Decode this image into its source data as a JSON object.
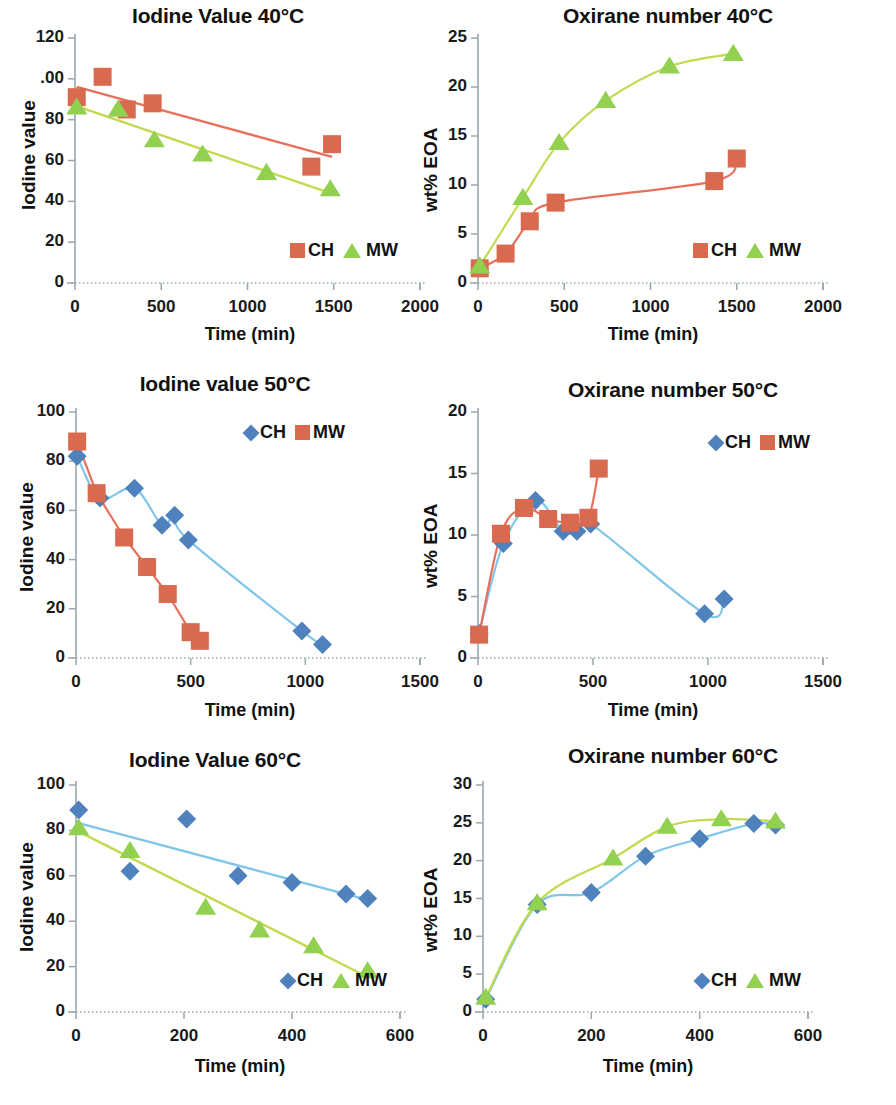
{
  "figure": {
    "panel_count": 6,
    "series_colors": {
      "CH_red": "#d9694f",
      "CH_blue": "#4f81bd",
      "MW_green": "#92d050",
      "trend_red": "#e8705b",
      "trend_green": "#c3d94e",
      "trend_blue": "#7fc6e8",
      "axis": "#9aa6ad"
    }
  },
  "chart_data": [
    {
      "id": "iodine-40",
      "type": "scatter",
      "title": "Iodine Value 40°C",
      "xlabel": "Time (min)",
      "ylabel": "Iodine value",
      "xlim": [
        0,
        2000
      ],
      "ylim": [
        0,
        120
      ],
      "xticks": [
        0,
        500,
        1000,
        1500,
        2000
      ],
      "yticks": [
        0,
        20,
        40,
        60,
        80,
        100,
        120
      ],
      "ytick_labels": [
        "0",
        "20",
        "40",
        "60",
        "80",
        ".00",
        "120"
      ],
      "grid": false,
      "legend_position": "bottom-right",
      "series": [
        {
          "name": "CH",
          "marker": "square",
          "color": "#d9694f",
          "trend": "linear",
          "trend_color": "#e8705b",
          "x": [
            10,
            160,
            300,
            450,
            1370,
            1490
          ],
          "y": [
            91,
            101,
            85,
            88,
            57,
            68
          ]
        },
        {
          "name": "MW",
          "marker": "triangle",
          "color": "#92d050",
          "trend": "linear",
          "trend_color": "#c3d94e",
          "x": [
            10,
            250,
            460,
            740,
            1110,
            1480
          ],
          "y": [
            86,
            85,
            70,
            63,
            54,
            46
          ]
        }
      ]
    },
    {
      "id": "oxirane-40",
      "type": "scatter",
      "title": "Oxirane number 40°C",
      "xlabel": "Time (min)",
      "ylabel": "wt% EOA",
      "xlim": [
        0,
        2000
      ],
      "ylim": [
        0,
        25
      ],
      "xticks": [
        0,
        500,
        1000,
        1500,
        2000
      ],
      "yticks": [
        0,
        5,
        10,
        15,
        20,
        25
      ],
      "ytick_labels": [
        "0",
        "5",
        "10",
        "15",
        "20",
        "25"
      ],
      "grid": false,
      "legend_position": "bottom-right",
      "series": [
        {
          "name": "CH",
          "marker": "square",
          "color": "#d9694f",
          "trend": "smooth",
          "trend_color": "#e8705b",
          "x": [
            10,
            160,
            300,
            450,
            1370,
            1500
          ],
          "y": [
            1.5,
            3.0,
            6.3,
            8.2,
            10.4,
            12.7
          ]
        },
        {
          "name": "MW",
          "marker": "triangle",
          "color": "#92d050",
          "trend": "smooth",
          "trend_color": "#c3d94e",
          "x": [
            10,
            260,
            470,
            740,
            1110,
            1480
          ],
          "y": [
            1.7,
            8.7,
            14.3,
            18.6,
            22.1,
            23.4
          ]
        }
      ]
    },
    {
      "id": "iodine-50",
      "type": "scatter",
      "title": "Iodine value 50°C",
      "xlabel": "Time (min)",
      "ylabel": "Iodine value",
      "xlim": [
        0,
        1500
      ],
      "ylim": [
        0,
        100
      ],
      "xticks": [
        0,
        500,
        1000,
        1500
      ],
      "yticks": [
        0,
        20,
        40,
        60,
        80,
        100
      ],
      "ytick_labels": [
        "0",
        "20",
        "40",
        "60",
        "80",
        "100"
      ],
      "grid": false,
      "legend_position": "top-right",
      "series": [
        {
          "name": "CH",
          "marker": "diamond",
          "color": "#4f81bd",
          "trend": "smooth",
          "trend_color": "#7fc6e8",
          "x": [
            5,
            105,
            255,
            375,
            430,
            490,
            985,
            1075
          ],
          "y": [
            82,
            65,
            69,
            54,
            58,
            48,
            11,
            5.5
          ]
        },
        {
          "name": "MW",
          "marker": "square",
          "color": "#d9694f",
          "trend": "line",
          "trend_color": "#e8705b",
          "x": [
            5,
            90,
            210,
            310,
            400,
            500,
            540
          ],
          "y": [
            88,
            67,
            49,
            37,
            26,
            10.5,
            7
          ]
        }
      ]
    },
    {
      "id": "oxirane-50",
      "type": "scatter",
      "title": "Oxirane number 50°C",
      "xlabel": "Time (min)",
      "ylabel": "wt% EOA",
      "xlim": [
        0,
        1500
      ],
      "ylim": [
        0,
        20
      ],
      "xticks": [
        0,
        500,
        1000,
        1500
      ],
      "yticks": [
        0,
        5,
        10,
        15,
        20
      ],
      "ytick_labels": [
        "0",
        "5",
        "10",
        "15",
        "20"
      ],
      "grid": false,
      "legend_position": "top-right",
      "series": [
        {
          "name": "CH",
          "marker": "diamond",
          "color": "#4f81bd",
          "trend": "smooth",
          "trend_color": "#7fc6e8",
          "x": [
            5,
            110,
            250,
            370,
            430,
            490,
            985,
            1070
          ],
          "y": [
            2.0,
            9.3,
            12.8,
            10.3,
            10.3,
            10.9,
            3.6,
            4.8
          ]
        },
        {
          "name": "MW",
          "marker": "square",
          "color": "#d9694f",
          "trend": "smooth",
          "trend_color": "#e8705b",
          "x": [
            5,
            100,
            200,
            305,
            400,
            480,
            525
          ],
          "y": [
            1.9,
            10.1,
            12.2,
            11.3,
            11.0,
            11.4,
            15.4
          ]
        }
      ]
    },
    {
      "id": "iodine-60",
      "type": "scatter",
      "title": "Iodine Value 60°C",
      "xlabel": "Time (min)",
      "ylabel": "Iodine value",
      "xlim": [
        0,
        600
      ],
      "ylim": [
        0,
        100
      ],
      "xticks": [
        0,
        200,
        400,
        600
      ],
      "yticks": [
        0,
        20,
        40,
        60,
        80,
        100
      ],
      "ytick_labels": [
        "0",
        "20",
        "40",
        "60",
        "80",
        "100"
      ],
      "grid": false,
      "legend_position": "bottom-right",
      "series": [
        {
          "name": "CH",
          "marker": "diamond",
          "color": "#4f81bd",
          "trend": "linear",
          "trend_color": "#7fc6e8",
          "x": [
            5,
            100,
            205,
            300,
            400,
            500,
            540
          ],
          "y": [
            89,
            62,
            85,
            60,
            57,
            52,
            50
          ]
        },
        {
          "name": "MW",
          "marker": "triangle",
          "color": "#92d050",
          "trend": "linear",
          "trend_color": "#c3d94e",
          "x": [
            5,
            100,
            240,
            340,
            440,
            540
          ],
          "y": [
            81,
            71,
            46,
            36,
            29,
            18
          ]
        }
      ]
    },
    {
      "id": "oxirane-60",
      "type": "scatter",
      "title": "Oxirane number 60°C",
      "xlabel": "Time (min)",
      "ylabel": "wt% EOA",
      "xlim": [
        0,
        600
      ],
      "ylim": [
        0,
        30
      ],
      "xticks": [
        0,
        200,
        400,
        600
      ],
      "yticks": [
        0,
        5,
        10,
        15,
        20,
        25,
        30
      ],
      "ytick_labels": [
        "0",
        "5",
        "10",
        "15",
        "20",
        "25",
        "30"
      ],
      "grid": false,
      "legend_position": "bottom-right",
      "series": [
        {
          "name": "CH",
          "marker": "diamond",
          "color": "#4f81bd",
          "trend": "smooth",
          "trend_color": "#7fc6e8",
          "x": [
            5,
            100,
            200,
            300,
            400,
            500,
            540
          ],
          "y": [
            1.7,
            14.2,
            15.8,
            20.6,
            22.9,
            24.9,
            24.7
          ]
        },
        {
          "name": "MW",
          "marker": "triangle",
          "color": "#92d050",
          "trend": "smooth",
          "trend_color": "#c3d94e",
          "x": [
            5,
            100,
            240,
            340,
            440,
            540
          ],
          "y": [
            1.9,
            14.4,
            20.3,
            24.5,
            25.5,
            25.2
          ]
        }
      ]
    }
  ]
}
